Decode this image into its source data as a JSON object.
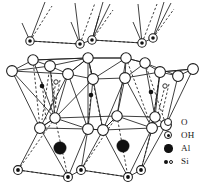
{
  "figure": {
    "width": 209,
    "height": 194,
    "background": "#ffffff",
    "line_color": "#1d1d1d"
  },
  "legend": {
    "items": [
      {
        "id": "o",
        "label": "O",
        "symbol": "open-circle",
        "color": "#ffffff",
        "stroke": "#1a1a1a"
      },
      {
        "id": "oh",
        "label": "OH",
        "symbol": "circle-with-dot",
        "color": "#ffffff",
        "stroke": "#1a1a1a"
      },
      {
        "id": "al",
        "label": "Al",
        "symbol": "filled-circle",
        "color": "#111111",
        "stroke": "#111111"
      },
      {
        "id": "si",
        "label": "Si",
        "symbol": "small-filled-and-open-circle",
        "color": "#111111",
        "stroke": "#1a1a1a"
      }
    ]
  },
  "structure": {
    "top_hydroxyl_row": {
      "atom_type": "OH",
      "radius": 4.2,
      "positions": [
        {
          "x": 30,
          "y": 41
        },
        {
          "x": 80,
          "y": 44
        },
        {
          "x": 92,
          "y": 40
        },
        {
          "x": 142,
          "y": 43
        },
        {
          "x": 153,
          "y": 38
        }
      ]
    },
    "upper_oxygen_row_back": {
      "atom_type": "O",
      "radius": 5.2,
      "positions": [
        {
          "x": 33,
          "y": 60
        },
        {
          "x": 88,
          "y": 58
        },
        {
          "x": 126,
          "y": 58
        },
        {
          "x": 145,
          "y": 63
        }
      ]
    },
    "upper_oxygen_row_front": {
      "atom_type": "O",
      "radius": 5.4,
      "positions": [
        {
          "x": 12,
          "y": 71
        },
        {
          "x": 50,
          "y": 66
        },
        {
          "x": 68,
          "y": 74
        },
        {
          "x": 93,
          "y": 79
        },
        {
          "x": 125,
          "y": 78
        },
        {
          "x": 160,
          "y": 72
        },
        {
          "x": 178,
          "y": 76
        },
        {
          "x": 193,
          "y": 69
        }
      ]
    },
    "silicon_atoms": {
      "atom_type": "Si",
      "filled_radius": 2.3,
      "open_radius": 2.2,
      "filled_positions": [
        {
          "x": 42,
          "y": 86
        },
        {
          "x": 91,
          "y": 95
        },
        {
          "x": 151,
          "y": 92
        }
      ],
      "open_positions": [
        {
          "x": 56,
          "y": 82
        },
        {
          "x": 165,
          "y": 86
        }
      ]
    },
    "lower_oxygen_row_back": {
      "atom_type": "O",
      "radius": 5.2,
      "positions": [
        {
          "x": 55,
          "y": 118
        },
        {
          "x": 117,
          "y": 116
        },
        {
          "x": 155,
          "y": 117
        }
      ]
    },
    "lower_oxygen_row_front": {
      "atom_type": "O",
      "radius": 5.4,
      "positions": [
        {
          "x": 40,
          "y": 128
        },
        {
          "x": 88,
          "y": 129
        },
        {
          "x": 103,
          "y": 130
        },
        {
          "x": 152,
          "y": 128
        },
        {
          "x": 166,
          "y": 125
        }
      ]
    },
    "aluminium_atoms": {
      "atom_type": "Al",
      "radius": 6.2,
      "positions": [
        {
          "x": 60,
          "y": 148
        },
        {
          "x": 123,
          "y": 146
        }
      ]
    },
    "bottom_hydroxyl_row": {
      "atom_type": "OH",
      "radius": 4.4,
      "positions": [
        {
          "x": 18,
          "y": 170
        },
        {
          "x": 68,
          "y": 177
        },
        {
          "x": 81,
          "y": 170
        },
        {
          "x": 128,
          "y": 177
        },
        {
          "x": 141,
          "y": 170
        }
      ]
    }
  }
}
